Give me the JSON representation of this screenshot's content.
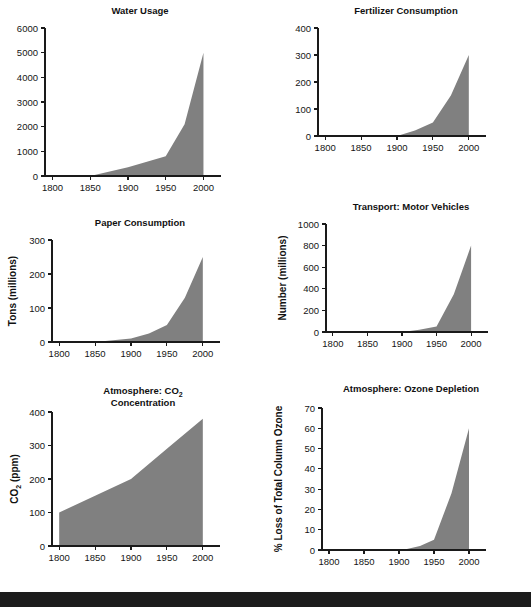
{
  "figure": {
    "name": "great-acceleration-socioeconomic-trends",
    "background_color": "#ffffff",
    "fill_color": "#808080",
    "axis_color": "#1a1a1a",
    "page_edge_color": "#1c1c1c",
    "rows": 3,
    "columns": 2
  },
  "chart_data": [
    {
      "type": "area",
      "id": "water-usage",
      "title": "Water Usage",
      "title_lines": [
        "Water Usage"
      ],
      "xlabel": "",
      "ylabel": "",
      "ylabel_lines": [],
      "x": [
        1800,
        1850,
        1900,
        1950,
        1975,
        2000
      ],
      "values": [
        0,
        0,
        350,
        800,
        2100,
        5000
      ],
      "xlim": [
        1790,
        2010
      ],
      "ylim": [
        0,
        6000
      ],
      "xticks": [
        1800,
        1850,
        1900,
        1950,
        2000
      ],
      "xtick_labels": [
        "1800",
        "1850",
        "1900",
        "1950",
        "2000"
      ],
      "yticks": [
        0,
        1000,
        2000,
        3000,
        4000,
        5000,
        6000
      ],
      "ytick_labels": [
        "0",
        "1000",
        "2000",
        "3000",
        "4000",
        "5000",
        "6000"
      ],
      "grid": false,
      "legend": false
    },
    {
      "type": "area",
      "id": "fertilizer-consumption",
      "title": "Fertilizer Consumption",
      "title_lines": [
        "Fertilizer Consumption"
      ],
      "xlabel": "",
      "ylabel": "",
      "ylabel_lines": [],
      "x": [
        1800,
        1900,
        1925,
        1950,
        1975,
        2000
      ],
      "values": [
        0,
        0,
        20,
        50,
        150,
        300
      ],
      "xlim": [
        1790,
        2010
      ],
      "ylim": [
        0,
        400
      ],
      "xticks": [
        1800,
        1850,
        1900,
        1950,
        2000
      ],
      "xtick_labels": [
        "1800",
        "1850",
        "1900",
        "1950",
        "2000"
      ],
      "yticks": [
        0,
        100,
        200,
        300,
        400
      ],
      "ytick_labels": [
        "0",
        "100",
        "200",
        "300",
        "400"
      ],
      "grid": false,
      "legend": false
    },
    {
      "type": "area",
      "id": "paper-consumption",
      "title": "Paper Consumption",
      "title_lines": [
        "Paper Consumption"
      ],
      "xlabel": "",
      "ylabel": "Tons (millions)",
      "ylabel_lines": [
        "Tons (millions)"
      ],
      "x": [
        1800,
        1850,
        1900,
        1925,
        1950,
        1975,
        2000
      ],
      "values": [
        0,
        0,
        10,
        25,
        50,
        130,
        250
      ],
      "xlim": [
        1790,
        2010
      ],
      "ylim": [
        0,
        300
      ],
      "xticks": [
        1800,
        1850,
        1900,
        1950,
        2000
      ],
      "xtick_labels": [
        "1800",
        "1850",
        "1900",
        "1950",
        "2000"
      ],
      "yticks": [
        0,
        100,
        200,
        300
      ],
      "ytick_labels": [
        "0",
        "100",
        "200",
        "300"
      ],
      "grid": false,
      "legend": false
    },
    {
      "type": "area",
      "id": "transport-motor-vehicles",
      "title": "Transport: Motor Vehicles",
      "title_lines": [
        "Transport: Motor Vehicles"
      ],
      "xlabel": "",
      "ylabel": "Number (millions)",
      "ylabel_lines": [
        "Number (millions)"
      ],
      "x": [
        1800,
        1900,
        1925,
        1950,
        1975,
        2000
      ],
      "values": [
        0,
        0,
        20,
        50,
        350,
        800
      ],
      "xlim": [
        1790,
        2010
      ],
      "ylim": [
        0,
        1000
      ],
      "xticks": [
        1800,
        1850,
        1900,
        1950,
        2000
      ],
      "xtick_labels": [
        "1800",
        "1850",
        "1900",
        "1950",
        "2000"
      ],
      "yticks": [
        0,
        200,
        400,
        600,
        800,
        1000
      ],
      "ytick_labels": [
        "0",
        "200",
        "400",
        "600",
        "800",
        "1000"
      ],
      "grid": false,
      "legend": false
    },
    {
      "type": "area",
      "id": "atmosphere-co2-concentration",
      "title": "Atmosphere: CO2 Concentration",
      "title_lines": [
        "Atmosphere: CO",
        "Concentration"
      ],
      "title_subscript": "2",
      "xlabel": "",
      "ylabel": "CO2 (ppm)",
      "ylabel_prefix": "CO",
      "ylabel_subscript": "2",
      "ylabel_suffix": " (ppm)",
      "x": [
        1800,
        1850,
        1900,
        1950,
        2000
      ],
      "values": [
        100,
        150,
        200,
        290,
        380
      ],
      "xlim": [
        1790,
        2010
      ],
      "ylim": [
        0,
        400
      ],
      "xticks": [
        1800,
        1850,
        1900,
        1950,
        2000
      ],
      "xtick_labels": [
        "1800",
        "1850",
        "1900",
        "1950",
        "2000"
      ],
      "yticks": [
        0,
        100,
        200,
        300,
        400
      ],
      "ytick_labels": [
        "0",
        "100",
        "200",
        "300",
        "400"
      ],
      "grid": false,
      "legend": false
    },
    {
      "type": "area",
      "id": "atmosphere-ozone-depletion",
      "title": "Atmosphere: Ozone Depletion",
      "title_lines": [
        "Atmosphere: Ozone Depletion"
      ],
      "xlabel": "",
      "ylabel": "% Loss of Total Column Ozone",
      "ylabel_lines": [
        "% Loss of Total Column Ozone"
      ],
      "x": [
        1800,
        1905,
        1930,
        1950,
        1975,
        2000
      ],
      "values": [
        0,
        0,
        2,
        5,
        28,
        60
      ],
      "xlim": [
        1790,
        2010
      ],
      "ylim": [
        0,
        70
      ],
      "xticks": [
        1800,
        1850,
        1900,
        1950,
        2000
      ],
      "xtick_labels": [
        "1800",
        "1850",
        "1900",
        "1950",
        "2000"
      ],
      "yticks": [
        0,
        10,
        20,
        30,
        40,
        50,
        60,
        70
      ],
      "ytick_labels": [
        "0",
        "10",
        "20",
        "30",
        "40",
        "50",
        "60",
        "70"
      ],
      "grid": false,
      "legend": false
    }
  ]
}
